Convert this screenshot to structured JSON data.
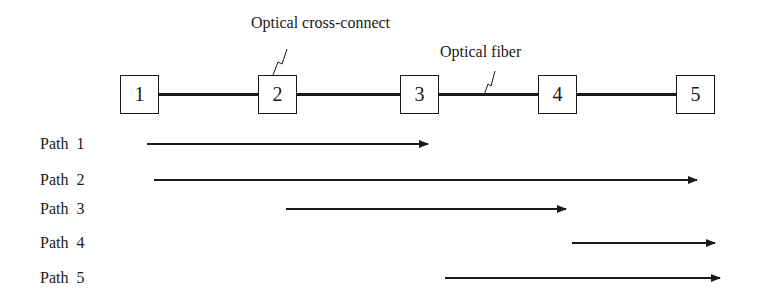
{
  "diagram": {
    "nodes": [
      {
        "id": "1",
        "label": "1"
      },
      {
        "id": "2",
        "label": "2"
      },
      {
        "id": "3",
        "label": "3"
      },
      {
        "id": "4",
        "label": "4"
      },
      {
        "id": "5",
        "label": "5"
      }
    ],
    "annotations": {
      "cross_connect": "Optical cross-connect",
      "fiber": "Optical fiber"
    },
    "paths": [
      {
        "label": "Path  1",
        "from": "1",
        "to": "3"
      },
      {
        "label": "Path  2",
        "from": "1",
        "to": "5"
      },
      {
        "label": "Path  3",
        "from": "2",
        "to": "4"
      },
      {
        "label": "Path  4",
        "from": "4",
        "to": "5"
      },
      {
        "label": "Path  5",
        "from": "3",
        "to": "5"
      }
    ],
    "colors": {
      "stroke": "#1a1a1a",
      "background": "#ffffff"
    }
  }
}
